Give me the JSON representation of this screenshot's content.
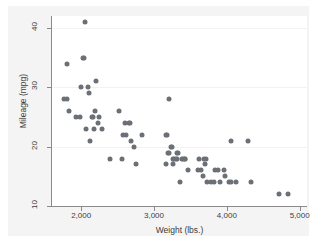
{
  "chart_data": {
    "type": "scatter",
    "title": "",
    "subtitle": "",
    "xlabel": "Weight (lbs.)",
    "ylabel": "Mileage (mpg)",
    "xlim": [
      1600,
      5100
    ],
    "ylim": [
      10,
      42
    ],
    "xticks": [
      2000,
      3000,
      4000,
      5000
    ],
    "xtick_labels": [
      "2,000",
      "3,000",
      "4,000",
      "5,000"
    ],
    "yticks": [
      10,
      20,
      30,
      40
    ],
    "ytick_labels": [
      "10",
      "20",
      "30",
      "40"
    ],
    "grid": "horizontal",
    "legend": "none",
    "marker_color": "#6b6f76",
    "marker_shape": "circle",
    "plot_background": "#ffffff",
    "graph_background": "#f4f4f4",
    "gridline_color": "#f2f2f2",
    "axis_color": "#8a8a8a",
    "text_color": "#3d3d3d",
    "n_points": 74,
    "points": [
      {
        "x": 1760,
        "y": 28
      },
      {
        "x": 1800,
        "y": 28
      },
      {
        "x": 1800,
        "y": 34
      },
      {
        "x": 1830,
        "y": 26
      },
      {
        "x": 1930,
        "y": 25
      },
      {
        "x": 1980,
        "y": 25
      },
      {
        "x": 2000,
        "y": 30
      },
      {
        "x": 2020,
        "y": 35
      },
      {
        "x": 2040,
        "y": 35
      },
      {
        "x": 2050,
        "y": 41
      },
      {
        "x": 2070,
        "y": 23
      },
      {
        "x": 2100,
        "y": 30
      },
      {
        "x": 2110,
        "y": 29
      },
      {
        "x": 2120,
        "y": 21
      },
      {
        "x": 2150,
        "y": 25
      },
      {
        "x": 2160,
        "y": 25
      },
      {
        "x": 2170,
        "y": 23
      },
      {
        "x": 2190,
        "y": 26
      },
      {
        "x": 2200,
        "y": 31
      },
      {
        "x": 2230,
        "y": 24
      },
      {
        "x": 2240,
        "y": 25
      },
      {
        "x": 2280,
        "y": 23
      },
      {
        "x": 2400,
        "y": 18
      },
      {
        "x": 2520,
        "y": 26
      },
      {
        "x": 2560,
        "y": 18
      },
      {
        "x": 2580,
        "y": 22
      },
      {
        "x": 2600,
        "y": 24
      },
      {
        "x": 2620,
        "y": 22
      },
      {
        "x": 2650,
        "y": 24
      },
      {
        "x": 2670,
        "y": 24
      },
      {
        "x": 2690,
        "y": 21
      },
      {
        "x": 2730,
        "y": 20
      },
      {
        "x": 2750,
        "y": 17
      },
      {
        "x": 2830,
        "y": 22
      },
      {
        "x": 3170,
        "y": 22
      },
      {
        "x": 3180,
        "y": 22
      },
      {
        "x": 3170,
        "y": 17
      },
      {
        "x": 3190,
        "y": 19
      },
      {
        "x": 3200,
        "y": 28
      },
      {
        "x": 3210,
        "y": 19
      },
      {
        "x": 3230,
        "y": 20
      },
      {
        "x": 3250,
        "y": 20
      },
      {
        "x": 3260,
        "y": 17
      },
      {
        "x": 3260,
        "y": 18
      },
      {
        "x": 3280,
        "y": 18
      },
      {
        "x": 3300,
        "y": 18
      },
      {
        "x": 3310,
        "y": 18
      },
      {
        "x": 3320,
        "y": 19
      },
      {
        "x": 3330,
        "y": 19
      },
      {
        "x": 3350,
        "y": 14
      },
      {
        "x": 3380,
        "y": 18
      },
      {
        "x": 3400,
        "y": 18
      },
      {
        "x": 3420,
        "y": 18
      },
      {
        "x": 3430,
        "y": 18
      },
      {
        "x": 3470,
        "y": 16
      },
      {
        "x": 3600,
        "y": 16
      },
      {
        "x": 3620,
        "y": 18
      },
      {
        "x": 3640,
        "y": 16
      },
      {
        "x": 3670,
        "y": 15
      },
      {
        "x": 3690,
        "y": 18
      },
      {
        "x": 3700,
        "y": 17
      },
      {
        "x": 3720,
        "y": 18
      },
      {
        "x": 3730,
        "y": 14
      },
      {
        "x": 3780,
        "y": 14
      },
      {
        "x": 3830,
        "y": 14
      },
      {
        "x": 3840,
        "y": 16
      },
      {
        "x": 3880,
        "y": 16
      },
      {
        "x": 3900,
        "y": 14
      },
      {
        "x": 3960,
        "y": 16
      },
      {
        "x": 3980,
        "y": 15
      },
      {
        "x": 4030,
        "y": 14
      },
      {
        "x": 4060,
        "y": 21
      },
      {
        "x": 4060,
        "y": 14
      },
      {
        "x": 4130,
        "y": 14
      },
      {
        "x": 4290,
        "y": 21
      },
      {
        "x": 4330,
        "y": 14
      },
      {
        "x": 4720,
        "y": 12
      },
      {
        "x": 4840,
        "y": 12
      }
    ]
  }
}
